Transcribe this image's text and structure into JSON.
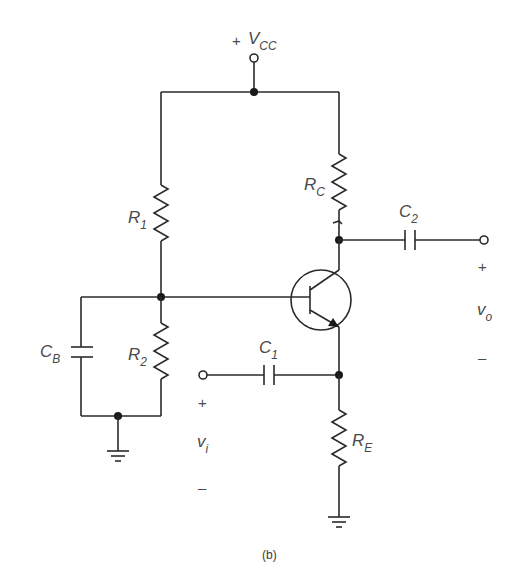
{
  "diagram": {
    "type": "circuit-schematic",
    "caption": "(b)",
    "supply": {
      "sign": "+",
      "label": "V",
      "sub": "CC"
    },
    "components": {
      "R1": {
        "label": "R",
        "sub": "1"
      },
      "R2": {
        "label": "R",
        "sub": "2"
      },
      "RC": {
        "label": "R",
        "sub": "C"
      },
      "RE": {
        "label": "R",
        "sub": "E"
      },
      "C1": {
        "label": "C",
        "sub": "1"
      },
      "C2": {
        "label": "C",
        "sub": "2"
      },
      "CB": {
        "label": "C",
        "sub": "B"
      }
    },
    "input": {
      "plus": "+",
      "label": "v",
      "sub": "i",
      "minus": "–"
    },
    "output": {
      "plus": "+",
      "label": "v",
      "sub": "o",
      "minus": "–"
    },
    "transistor": "npn-bjt"
  }
}
